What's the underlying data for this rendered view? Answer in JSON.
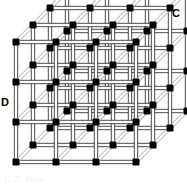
{
  "figure": {
    "background_color": "#ffffff",
    "width": 187,
    "height": 185
  },
  "labels": {
    "top_right": "C",
    "left_middle": "D"
  },
  "caption": {
    "text": "C. D. Hunt"
  },
  "style": {
    "node_color": "#000000",
    "bar_fill": "#ffffff",
    "bar_edge": "#2b2b2b",
    "bar_edge_light": "#9a9a9a",
    "node_size": 7,
    "bar_thickness": 3.4
  },
  "chart_data": {
    "type": "scatter",
    "xlabel": "",
    "ylabel": "",
    "grid": false,
    "projection": "oblique",
    "lattice": {
      "nx": 4,
      "ny": 4,
      "nz": 4,
      "origin_x": 16,
      "origin_y": 162,
      "step_x": 40,
      "step_y": 40,
      "depth_dx": 17,
      "depth_dy": -17
    },
    "annotations": [
      {
        "text": "C",
        "x": 172,
        "y": 8
      },
      {
        "text": "D",
        "x": 1,
        "y": 97
      }
    ]
  }
}
